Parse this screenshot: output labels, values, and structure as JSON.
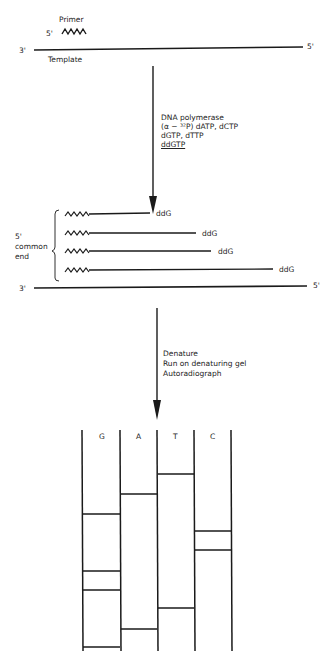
{
  "step1": {
    "primer_label": "Primer",
    "primer_end": "5'",
    "template_left": "3'",
    "template_right": "5'",
    "template_label": "Template"
  },
  "reaction": {
    "lines": [
      "DNA polymerase",
      "(α − ³²P) dATP, dCTP",
      "dGTP, dTTP",
      "ddGTP"
    ]
  },
  "step2": {
    "bracket_label": [
      "5'",
      "common",
      "end"
    ],
    "fragments": [
      {
        "terminator": "ddG",
        "length": 60
      },
      {
        "terminator": "ddG",
        "length": 107
      },
      {
        "terminator": "ddG",
        "length": 122
      },
      {
        "terminator": "ddG",
        "length": 185
      }
    ],
    "template_left": "3'",
    "template_right": "5'"
  },
  "processing": {
    "lines": [
      "Denature",
      "Run on denaturing gel",
      "Autoradiograph"
    ]
  },
  "gel": {
    "lanes": [
      {
        "label": "G",
        "bands_y": [
          514,
          571,
          590,
          647
        ]
      },
      {
        "label": "A",
        "bands_y": [
          494,
          629
        ]
      },
      {
        "label": "T",
        "bands_y": [
          474,
          608
        ]
      },
      {
        "label": "C",
        "bands_y": [
          531,
          550
        ]
      }
    ]
  }
}
